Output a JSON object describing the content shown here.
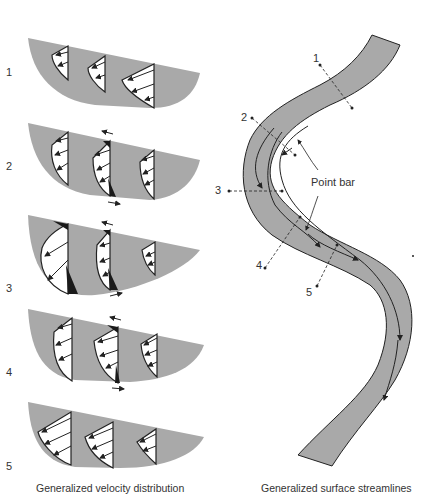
{
  "left_panel": {
    "caption": "Generalized velocity distribution",
    "sections": [
      {
        "label": "1"
      },
      {
        "label": "2"
      },
      {
        "label": "3"
      },
      {
        "label": "4"
      },
      {
        "label": "5"
      }
    ]
  },
  "right_panel": {
    "caption": "Generalized surface streamlines",
    "annotation": "Point bar",
    "section_labels": [
      "1",
      "2",
      "3",
      "4",
      "5"
    ]
  },
  "colors": {
    "channel_fill": "#a9a9a9",
    "profile_fill": "#ffffff",
    "outline": "#222222",
    "shade": "#1a1a1a"
  }
}
